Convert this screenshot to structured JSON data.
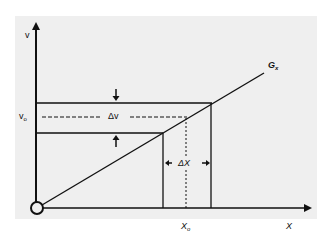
{
  "diagram": {
    "type": "transfer-characteristic",
    "colors": {
      "background": "#efefef",
      "stroke": "#111111",
      "page": "#ffffff"
    },
    "labels": {
      "y_axis": "v",
      "y_operating_point": "v",
      "y_operating_point_sub": "o",
      "delta_v": "Δv",
      "delta_x": "ΔX",
      "x_operating_point": "X",
      "x_operating_point_sub": "o",
      "x_axis": "X",
      "curve": "G",
      "curve_sub": "x"
    }
  }
}
